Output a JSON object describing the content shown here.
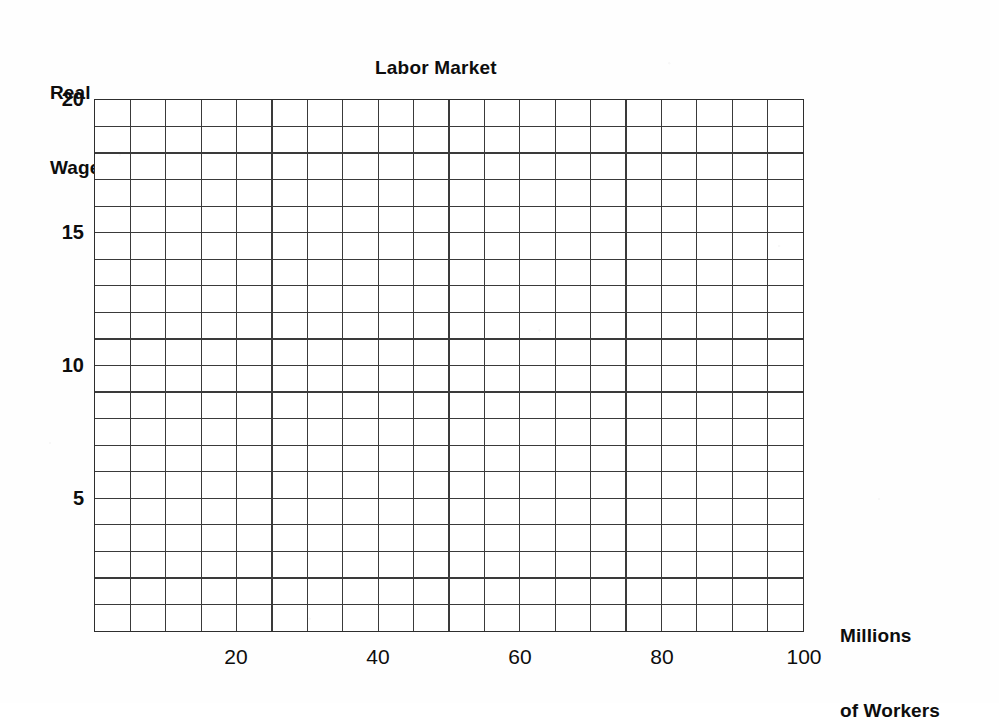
{
  "chart_data": {
    "type": "table",
    "title": "Labor Market",
    "xlabel": "Millions of Workers",
    "ylabel": "Real Wage",
    "xlim": [
      0,
      100
    ],
    "ylim": [
      0,
      20
    ],
    "grid": true,
    "legend": null,
    "series": [],
    "x_ticks": [
      {
        "value": 20,
        "label": "20"
      },
      {
        "value": 40,
        "label": "40"
      },
      {
        "value": 60,
        "label": "60"
      },
      {
        "value": 80,
        "label": "80"
      },
      {
        "value": 100,
        "label": "100"
      }
    ],
    "y_ticks": [
      {
        "value": 20,
        "label": "20"
      },
      {
        "value": 15,
        "label": "15"
      },
      {
        "value": 10,
        "label": "10"
      },
      {
        "value": 5,
        "label": "5"
      }
    ],
    "grid_columns": 20,
    "grid_rows": 20,
    "x_gridline_step": 5,
    "y_gridline_step": 1
  },
  "chart": {
    "title": "Labor Market",
    "y_axis_label_line1": "Real",
    "y_axis_label_line2": "Wage",
    "x_axis_label_line1": "Millions",
    "x_axis_label_line2": "of Workers",
    "y_tick_labels": [
      "20",
      "15",
      "10",
      "5"
    ],
    "x_tick_labels": [
      "20",
      "40",
      "60",
      "80",
      "100"
    ]
  },
  "colors": {
    "background": "#fefefe",
    "plot_background": "#ffffff",
    "grid_line": "#3a3a3a",
    "frame_line": "#2e2e2e",
    "text": "#0d0d0d"
  }
}
